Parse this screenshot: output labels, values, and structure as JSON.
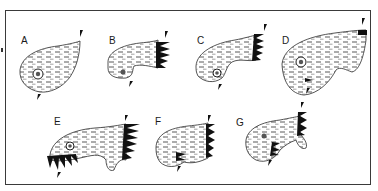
{
  "figure": {
    "panels": [
      {
        "id": "A",
        "label": "A",
        "position": "top-1"
      },
      {
        "id": "B",
        "label": "B",
        "position": "top-2"
      },
      {
        "id": "C",
        "label": "C",
        "position": "top-3"
      },
      {
        "id": "D",
        "label": "D",
        "position": "top-4"
      },
      {
        "id": "E",
        "label": "E",
        "position": "bottom-1"
      },
      {
        "id": "F",
        "label": "F",
        "position": "bottom-2"
      },
      {
        "id": "G",
        "label": "G",
        "position": "bottom-3"
      }
    ],
    "colors": {
      "ink": "#111111",
      "border": "#3a3a3a",
      "background": "#ffffff"
    }
  }
}
